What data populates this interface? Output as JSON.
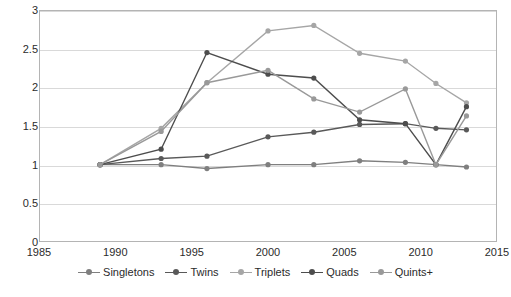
{
  "chart_data": {
    "type": "line",
    "title": "",
    "xlabel": "",
    "ylabel": "",
    "xlim": [
      1985,
      2015
    ],
    "ylim": [
      0,
      3
    ],
    "xticks": [
      1985,
      1990,
      1995,
      2000,
      2005,
      2010,
      2015
    ],
    "yticks": [
      0,
      0.5,
      1,
      1.5,
      2,
      2.5,
      3
    ],
    "grid": true,
    "legend_position": "bottom",
    "series": [
      {
        "name": "Singletons",
        "color": "#7f7f7f",
        "x": [
          1989,
          1993,
          1996,
          2000,
          2003,
          2006,
          2009,
          2011,
          2013
        ],
        "values": [
          1.0,
          1.0,
          0.95,
          1.0,
          1.0,
          1.05,
          1.03,
          1.0,
          0.97
        ]
      },
      {
        "name": "Twins",
        "color": "#595959",
        "x": [
          1989,
          1993,
          1996,
          2000,
          2003,
          2006,
          2009,
          2011,
          2013
        ],
        "values": [
          1.0,
          1.08,
          1.11,
          1.36,
          1.42,
          1.52,
          1.53,
          1.47,
          1.45
        ]
      },
      {
        "name": "Triplets",
        "color": "#a6a6a6",
        "x": [
          1989,
          1993,
          1996,
          2000,
          2003,
          2006,
          2009,
          2011,
          2013
        ],
        "values": [
          1.0,
          1.47,
          2.06,
          2.73,
          2.8,
          2.44,
          2.34,
          2.05,
          1.8
        ]
      },
      {
        "name": "Quads",
        "color": "#4d4d4d",
        "x": [
          1989,
          1993,
          1996,
          2000,
          2003,
          2006,
          2009,
          2011,
          2013
        ],
        "values": [
          1.0,
          1.2,
          2.45,
          2.17,
          2.12,
          1.58,
          1.53,
          1.0,
          1.75
        ]
      },
      {
        "name": "Quints+",
        "color": "#999999",
        "x": [
          1989,
          1993,
          1996,
          2000,
          2003,
          2006,
          2009,
          2011,
          2013
        ],
        "values": [
          1.0,
          1.43,
          2.06,
          2.22,
          1.85,
          1.68,
          1.98,
          1.0,
          1.63
        ]
      }
    ]
  },
  "axes": {
    "y_labels": [
      "3",
      "2.5",
      "2",
      "1.5",
      "1",
      "0.5",
      "0"
    ],
    "x_labels": [
      "1985",
      "1990",
      "1995",
      "2000",
      "2005",
      "2010",
      "2015"
    ]
  },
  "legend": {
    "items": [
      {
        "label": "Singletons",
        "color": "#7f7f7f"
      },
      {
        "label": "Twins",
        "color": "#595959"
      },
      {
        "label": "Triplets",
        "color": "#a6a6a6"
      },
      {
        "label": "Quads",
        "color": "#4d4d4d"
      },
      {
        "label": "Quints+",
        "color": "#999999"
      }
    ]
  }
}
